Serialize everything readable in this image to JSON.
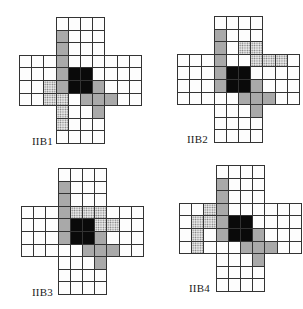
{
  "figure": {
    "cell_w": 12.2,
    "cell_h": 12.6,
    "panels": [
      {
        "id": "IIB1",
        "label": "IIB1",
        "origin": {
          "x": 19,
          "y": 17
        },
        "label_pos": {
          "x": 32,
          "y": 135
        },
        "cells": {
          "gray": [
            [
              1,
              3
            ],
            [
              2,
              3
            ],
            [
              3,
              3
            ],
            [
              4,
              3
            ],
            [
              5,
              3
            ],
            [
              5,
              6
            ],
            [
              6,
              5
            ],
            [
              6,
              6
            ],
            [
              6,
              7
            ],
            [
              7,
              6
            ]
          ],
          "black": [
            [
              4,
              4
            ],
            [
              4,
              5
            ],
            [
              5,
              4
            ],
            [
              5,
              5
            ]
          ],
          "dotted": [
            [
              5,
              2
            ],
            [
              6,
              2
            ],
            [
              6,
              3
            ],
            [
              7,
              3
            ],
            [
              8,
              3
            ]
          ]
        }
      },
      {
        "id": "IIB2",
        "label": "IIB2",
        "origin": {
          "x": 177,
          "y": 16
        },
        "label_pos": {
          "x": 187,
          "y": 133
        },
        "cells": {
          "gray": [
            [
              1,
              3
            ],
            [
              2,
              3
            ],
            [
              3,
              3
            ],
            [
              4,
              3
            ],
            [
              5,
              3
            ],
            [
              5,
              6
            ],
            [
              6,
              5
            ],
            [
              6,
              6
            ],
            [
              6,
              7
            ],
            [
              7,
              6
            ]
          ],
          "black": [
            [
              4,
              4
            ],
            [
              4,
              5
            ],
            [
              5,
              4
            ],
            [
              5,
              5
            ]
          ],
          "dotted": [
            [
              2,
              5
            ],
            [
              2,
              6
            ],
            [
              3,
              6
            ],
            [
              3,
              7
            ],
            [
              3,
              8
            ]
          ]
        }
      },
      {
        "id": "IIB3",
        "label": "IIB3",
        "origin": {
          "x": 21,
          "y": 168
        },
        "label_pos": {
          "x": 32,
          "y": 286
        },
        "cells": {
          "gray": [
            [
              1,
              3
            ],
            [
              2,
              3
            ],
            [
              3,
              3
            ],
            [
              4,
              3
            ],
            [
              5,
              3
            ],
            [
              5,
              6
            ],
            [
              6,
              5
            ],
            [
              6,
              6
            ],
            [
              6,
              7
            ],
            [
              7,
              6
            ]
          ],
          "black": [
            [
              4,
              4
            ],
            [
              4,
              5
            ],
            [
              5,
              4
            ],
            [
              5,
              5
            ]
          ],
          "dotted": [
            [
              3,
              4
            ],
            [
              3,
              5
            ],
            [
              3,
              6
            ],
            [
              4,
              6
            ],
            [
              4,
              7
            ]
          ]
        }
      },
      {
        "id": "IIB4",
        "label": "IIB4",
        "origin": {
          "x": 179,
          "y": 165
        },
        "label_pos": {
          "x": 189,
          "y": 282
        },
        "cells": {
          "gray": [
            [
              1,
              3
            ],
            [
              2,
              3
            ],
            [
              3,
              3
            ],
            [
              4,
              3
            ],
            [
              5,
              3
            ],
            [
              5,
              6
            ],
            [
              6,
              5
            ],
            [
              6,
              6
            ],
            [
              6,
              7
            ],
            [
              7,
              6
            ]
          ],
          "black": [
            [
              4,
              4
            ],
            [
              4,
              5
            ],
            [
              5,
              4
            ],
            [
              5,
              5
            ]
          ],
          "dotted": [
            [
              3,
              2
            ],
            [
              4,
              1
            ],
            [
              4,
              2
            ],
            [
              5,
              1
            ],
            [
              6,
              1
            ]
          ]
        }
      }
    ],
    "shape": {
      "rows": 10,
      "cols": 10,
      "vertical_arm_cols": [
        3,
        6
      ],
      "horizontal_arm_rows": [
        3,
        6
      ]
    },
    "legend": {
      "black": "center block",
      "gray": "shaded cells",
      "dotted": "stippled cells"
    }
  }
}
